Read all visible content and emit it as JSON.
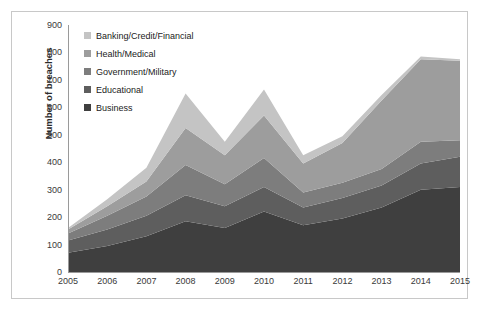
{
  "chart_data": {
    "type": "area",
    "title": "",
    "subtitle": "",
    "xlabel": "",
    "ylabel": "Number of breaches",
    "stacked": true,
    "grid": false,
    "legend_position": "top-left-inside",
    "categories": [
      "2005",
      "2006",
      "2007",
      "2008",
      "2009",
      "2010",
      "2011",
      "2012",
      "2013",
      "2014",
      "2015"
    ],
    "xlim": [
      "2005",
      "2015"
    ],
    "ylim": [
      0,
      900
    ],
    "y_ticks": [
      900,
      800,
      700,
      600,
      500,
      400,
      300,
      200,
      100,
      0
    ],
    "x_ticks": [
      "2005",
      "2006",
      "2007",
      "2008",
      "2009",
      "2010",
      "2011",
      "2012",
      "2013",
      "2014",
      "2015"
    ],
    "series": [
      {
        "name": "Business",
        "color": "#3f3f3f",
        "values": [
          70,
          95,
          130,
          185,
          160,
          220,
          170,
          195,
          235,
          300,
          310
        ]
      },
      {
        "name": "Educational",
        "color": "#5e5e5e",
        "values": [
          45,
          60,
          75,
          95,
          80,
          90,
          65,
          75,
          80,
          95,
          110
        ]
      },
      {
        "name": "Government/Military",
        "color": "#7d7d7d",
        "values": [
          25,
          50,
          70,
          110,
          80,
          105,
          55,
          55,
          60,
          80,
          60
        ]
      },
      {
        "name": "Health/Medical",
        "color": "#9d9d9d",
        "values": [
          15,
          35,
          55,
          135,
          105,
          155,
          105,
          145,
          250,
          300,
          290
        ]
      },
      {
        "name": "Banking/Credit/Financial",
        "color": "#c4c4c4",
        "values": [
          5,
          25,
          50,
          125,
          50,
          95,
          30,
          25,
          20,
          10,
          5
        ]
      }
    ],
    "totals": [
      160,
      265,
      380,
      650,
      475,
      665,
      425,
      495,
      645,
      785,
      775
    ]
  },
  "legend": {
    "items": [
      {
        "label": "Banking/Credit/Financial",
        "color": "#c4c4c4"
      },
      {
        "label": "Health/Medical",
        "color": "#9d9d9d"
      },
      {
        "label": "Government/Military",
        "color": "#7d7d7d"
      },
      {
        "label": "Educational",
        "color": "#5e5e5e"
      },
      {
        "label": "Business",
        "color": "#3f3f3f"
      }
    ]
  },
  "axes": {
    "y_title": "Number of breaches"
  },
  "colors": {
    "frame": "#c8c8c8",
    "axis": "#9a9a9a",
    "text": "#3a3a3a",
    "background": "#ffffff"
  }
}
